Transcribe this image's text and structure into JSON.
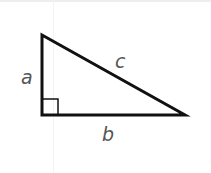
{
  "diagram": {
    "type": "right-triangle",
    "labels": {
      "leg_vertical": "a",
      "leg_horizontal": "b",
      "hypotenuse": "c"
    },
    "right_angle_marker": true,
    "colors": {
      "stroke": "#111111",
      "label": "#555555",
      "background": "#ffffff"
    }
  }
}
